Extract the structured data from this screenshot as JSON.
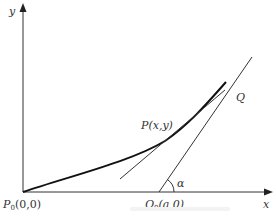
{
  "diagram": {
    "type": "geometry",
    "colors": {
      "axes": "#333333",
      "curve": "#111111",
      "lines": "#333333",
      "background": "#ffffff"
    },
    "axes": {
      "x_label": "x",
      "y_label": "y"
    },
    "points": {
      "origin": {
        "name": "P",
        "subscript": "0",
        "coords": "(0,0)"
      },
      "P": {
        "label": "P(x,y)"
      },
      "Q0": {
        "name": "Q",
        "subscript": "0",
        "coords": "(a,0)"
      },
      "Q": {
        "label": "Q"
      }
    },
    "angle": {
      "label": "α"
    }
  }
}
